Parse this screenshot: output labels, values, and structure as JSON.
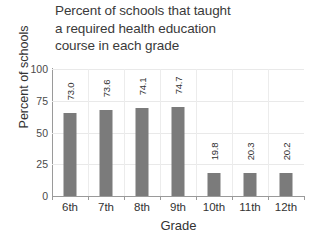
{
  "chart_data": {
    "type": "bar",
    "title": "Percent of schools that taught\na required health education\ncourse in each grade",
    "xlabel": "Grade",
    "ylabel": "Percent of schools",
    "categories": [
      "6th",
      "7th",
      "8th",
      "9th",
      "10th",
      "11th",
      "12th"
    ],
    "values": [
      73.0,
      73.6,
      74.1,
      74.7,
      19.8,
      20.3,
      20.2
    ],
    "value_labels": [
      "73.0",
      "73.6",
      "74.1",
      "74.7",
      "19.8",
      "20.3",
      "20.2"
    ],
    "drawn_values": [
      65.0,
      68.0,
      69.5,
      70.0,
      18.0,
      18.5,
      18.0
    ],
    "ylim": [
      0,
      100
    ],
    "yticks": [
      0,
      25,
      50,
      75,
      100
    ],
    "ytick_labels": [
      "0",
      "25",
      "50",
      "75",
      "100"
    ],
    "grid": true,
    "legend": "none",
    "bar_color": "#7b7b7b",
    "grid_color": "#e9e9e9",
    "axis_color": "#9a9a9a",
    "text_color": "#333333"
  }
}
